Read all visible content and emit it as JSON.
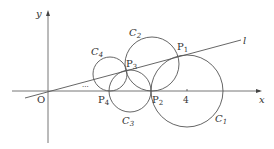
{
  "diagram": {
    "axes": {
      "x_label": "x",
      "y_label": "y",
      "origin_label": "O",
      "tick_label": "4"
    },
    "line_label": "l",
    "ellipsis": "···",
    "circles": [
      {
        "name": "C",
        "sub": "1"
      },
      {
        "name": "C",
        "sub": "2"
      },
      {
        "name": "C",
        "sub": "3"
      },
      {
        "name": "C",
        "sub": "4"
      }
    ],
    "points": [
      {
        "name": "P",
        "sub": "1"
      },
      {
        "name": "P",
        "sub": "2"
      },
      {
        "name": "P",
        "sub": "3"
      },
      {
        "name": "P",
        "sub": "4"
      }
    ],
    "colors": {
      "stroke": "#555555",
      "text": "#333333"
    }
  }
}
